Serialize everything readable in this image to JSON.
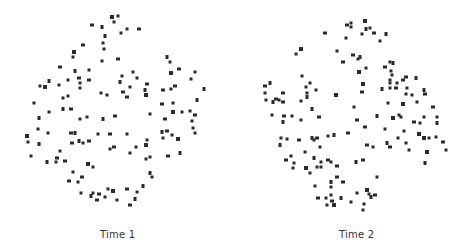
{
  "panels": [
    {
      "label": "Time 1",
      "dot_color": "#2a2a2a",
      "dots": [
        [
          112,
          17
        ],
        [
          118,
          16
        ],
        [
          114,
          22
        ],
        [
          92,
          25
        ],
        [
          102,
          27
        ],
        [
          127,
          29
        ],
        [
          139,
          29
        ],
        [
          121,
          33
        ],
        [
          105,
          36
        ],
        [
          83,
          45
        ],
        [
          103,
          43
        ],
        [
          104,
          49
        ],
        [
          74,
          52
        ],
        [
          73,
          57
        ],
        [
          102,
          61
        ],
        [
          118,
          59
        ],
        [
          167,
          57
        ],
        [
          170,
          62
        ],
        [
          60,
          67
        ],
        [
          89,
          70
        ],
        [
          75,
          71
        ],
        [
          179,
          69
        ],
        [
          133,
          72
        ],
        [
          195,
          72
        ],
        [
          171,
          73
        ],
        [
          122,
          76
        ],
        [
          137,
          78
        ],
        [
          79,
          78
        ],
        [
          49,
          81
        ],
        [
          68,
          80
        ],
        [
          89,
          80
        ],
        [
          191,
          79
        ],
        [
          120,
          82
        ],
        [
          147,
          84
        ],
        [
          80,
          83
        ],
        [
          40,
          86
        ],
        [
          45,
          87
        ],
        [
          59,
          85
        ],
        [
          80,
          88
        ],
        [
          175,
          86
        ],
        [
          204,
          89
        ],
        [
          130,
          87
        ],
        [
          163,
          90
        ],
        [
          171,
          89
        ],
        [
          145,
          90
        ],
        [
          123,
          92
        ],
        [
          101,
          93
        ],
        [
          107,
          95
        ],
        [
          146,
          95
        ],
        [
          68,
          96
        ],
        [
          63,
          98
        ],
        [
          127,
          97
        ],
        [
          197,
          100
        ],
        [
          34,
          103
        ],
        [
          162,
          104
        ],
        [
          173,
          103
        ],
        [
          63,
          109
        ],
        [
          71,
          109
        ],
        [
          49,
          112
        ],
        [
          190,
          111
        ],
        [
          173,
          112
        ],
        [
          182,
          112
        ],
        [
          150,
          114
        ],
        [
          195,
          115
        ],
        [
          39,
          118
        ],
        [
          87,
          117
        ],
        [
          115,
          116
        ],
        [
          80,
          119
        ],
        [
          103,
          119
        ],
        [
          165,
          119
        ],
        [
          192,
          121
        ],
        [
          38,
          129
        ],
        [
          27,
          136
        ],
        [
          28,
          142
        ],
        [
          48,
          133
        ],
        [
          71,
          133
        ],
        [
          75,
          133
        ],
        [
          98,
          134
        ],
        [
          110,
          134
        ],
        [
          127,
          134
        ],
        [
          162,
          132
        ],
        [
          167,
          131
        ],
        [
          172,
          135
        ],
        [
          163,
          138
        ],
        [
          178,
          139
        ],
        [
          193,
          128
        ],
        [
          195,
          133
        ],
        [
          72,
          143
        ],
        [
          79,
          141
        ],
        [
          83,
          143
        ],
        [
          89,
          141
        ],
        [
          147,
          140
        ],
        [
          39,
          144
        ],
        [
          114,
          147
        ],
        [
          110,
          149
        ],
        [
          136,
          147
        ],
        [
          146,
          145
        ],
        [
          60,
          151
        ],
        [
          130,
          153
        ],
        [
          168,
          156
        ],
        [
          180,
          153
        ],
        [
          31,
          156
        ],
        [
          57,
          158
        ],
        [
          56,
          162
        ],
        [
          47,
          162
        ],
        [
          65,
          161
        ],
        [
          146,
          159
        ],
        [
          150,
          157
        ],
        [
          88,
          164
        ],
        [
          93,
          167
        ],
        [
          73,
          172
        ],
        [
          82,
          177
        ],
        [
          150,
          173
        ],
        [
          152,
          177
        ],
        [
          69,
          181
        ],
        [
          78,
          182
        ],
        [
          143,
          186
        ],
        [
          127,
          189
        ],
        [
          108,
          189
        ],
        [
          137,
          192
        ],
        [
          113,
          191
        ],
        [
          81,
          193
        ],
        [
          93,
          193
        ],
        [
          99,
          194
        ],
        [
          91,
          196
        ],
        [
          105,
          197
        ],
        [
          97,
          200
        ],
        [
          117,
          200
        ],
        [
          135,
          199
        ],
        [
          130,
          205
        ]
      ]
    },
    {
      "label": "Time 2",
      "dot_color": "#2a2a2a",
      "dots": [
        [
          365,
          21
        ],
        [
          351,
          23
        ],
        [
          351,
          27
        ],
        [
          347,
          25
        ],
        [
          366,
          29
        ],
        [
          370,
          28
        ],
        [
          374,
          33
        ],
        [
          362,
          34
        ],
        [
          386,
          34
        ],
        [
          325,
          33
        ],
        [
          346,
          38
        ],
        [
          380,
          41
        ],
        [
          301,
          49
        ],
        [
          296,
          54
        ],
        [
          337,
          51
        ],
        [
          353,
          55
        ],
        [
          360,
          57
        ],
        [
          358,
          59
        ],
        [
          343,
          62
        ],
        [
          390,
          62
        ],
        [
          393,
          63
        ],
        [
          385,
          67
        ],
        [
          366,
          68
        ],
        [
          391,
          71
        ],
        [
          359,
          72
        ],
        [
          302,
          76
        ],
        [
          392,
          75
        ],
        [
          406,
          77
        ],
        [
          416,
          78
        ],
        [
          390,
          80
        ],
        [
          403,
          80
        ],
        [
          310,
          83
        ],
        [
          270,
          83
        ],
        [
          265,
          86
        ],
        [
          390,
          83
        ],
        [
          397,
          83
        ],
        [
          363,
          84
        ],
        [
          306,
          87
        ],
        [
          316,
          90
        ],
        [
          362,
          92
        ],
        [
          382,
          89
        ],
        [
          390,
          88
        ],
        [
          396,
          88
        ],
        [
          407,
          88
        ],
        [
          424,
          90
        ],
        [
          283,
          93
        ],
        [
          265,
          93
        ],
        [
          307,
          93
        ],
        [
          336,
          95
        ],
        [
          406,
          94
        ],
        [
          412,
          95
        ],
        [
          425,
          94
        ],
        [
          307,
          97
        ],
        [
          266,
          100
        ],
        [
          276,
          99
        ],
        [
          279,
          100
        ],
        [
          273,
          102
        ],
        [
          283,
          102
        ],
        [
          301,
          101
        ],
        [
          388,
          103
        ],
        [
          403,
          104
        ],
        [
          417,
          102
        ],
        [
          354,
          107
        ],
        [
          433,
          107
        ],
        [
          312,
          109
        ],
        [
          272,
          115
        ],
        [
          284,
          116
        ],
        [
          292,
          116
        ],
        [
          377,
          116
        ],
        [
          319,
          117
        ],
        [
          399,
          115
        ],
        [
          401,
          117
        ],
        [
          393,
          118
        ],
        [
          424,
          117
        ],
        [
          437,
          117
        ],
        [
          357,
          120
        ],
        [
          283,
          122
        ],
        [
          301,
          120
        ],
        [
          414,
          122
        ],
        [
          420,
          123
        ],
        [
          437,
          123
        ],
        [
          365,
          127
        ],
        [
          385,
          129
        ],
        [
          404,
          131
        ],
        [
          419,
          134
        ],
        [
          281,
          138
        ],
        [
          287,
          139
        ],
        [
          299,
          140
        ],
        [
          312,
          138
        ],
        [
          314,
          140
        ],
        [
          317,
          138
        ],
        [
          328,
          136
        ],
        [
          334,
          135
        ],
        [
          348,
          133
        ],
        [
          398,
          138
        ],
        [
          406,
          143
        ],
        [
          424,
          138
        ],
        [
          429,
          138
        ],
        [
          436,
          137
        ],
        [
          443,
          142
        ],
        [
          280,
          145
        ],
        [
          320,
          147
        ],
        [
          367,
          145
        ],
        [
          373,
          147
        ],
        [
          387,
          143
        ],
        [
          390,
          147
        ],
        [
          409,
          150
        ],
        [
          305,
          152
        ],
        [
          427,
          152
        ],
        [
          446,
          150
        ],
        [
          291,
          156
        ],
        [
          286,
          160
        ],
        [
          314,
          158
        ],
        [
          321,
          162
        ],
        [
          328,
          160
        ],
        [
          331,
          162
        ],
        [
          356,
          162
        ],
        [
          363,
          160
        ],
        [
          294,
          163
        ],
        [
          293,
          168
        ],
        [
          306,
          168
        ],
        [
          317,
          167
        ],
        [
          321,
          167
        ],
        [
          337,
          166
        ],
        [
          425,
          163
        ],
        [
          310,
          173
        ],
        [
          337,
          177
        ],
        [
          377,
          177
        ],
        [
          331,
          182
        ],
        [
          343,
          182
        ],
        [
          331,
          187
        ],
        [
          315,
          186
        ],
        [
          367,
          190
        ],
        [
          357,
          193
        ],
        [
          369,
          194
        ],
        [
          375,
          195
        ],
        [
          371,
          197
        ],
        [
          331,
          195
        ],
        [
          318,
          198
        ],
        [
          326,
          198
        ],
        [
          341,
          198
        ],
        [
          332,
          201
        ],
        [
          351,
          202
        ],
        [
          327,
          205
        ],
        [
          334,
          205
        ],
        [
          364,
          204
        ],
        [
          363,
          210
        ]
      ]
    }
  ]
}
